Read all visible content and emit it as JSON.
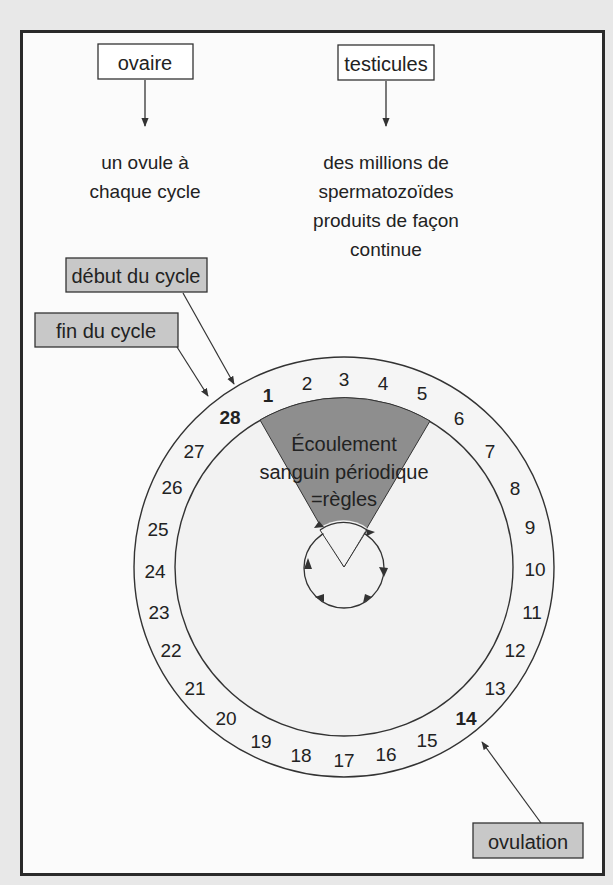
{
  "top_boxes": {
    "ovary": {
      "label": "ovaire",
      "description_lines": [
        "un ovule à",
        "chaque cycle"
      ]
    },
    "testes": {
      "label": "testicules",
      "description_lines": [
        "des millions de",
        "spermatozoïdes",
        "produits de façon",
        "continue"
      ]
    }
  },
  "callouts": {
    "cycle_start": "début du cycle",
    "cycle_end": "fin du cycle",
    "ovulation": "ovulation"
  },
  "cycle_wheel": {
    "days": [
      "1",
      "2",
      "3",
      "4",
      "5",
      "6",
      "7",
      "8",
      "9",
      "10",
      "11",
      "12",
      "13",
      "14",
      "15",
      "16",
      "17",
      "18",
      "19",
      "20",
      "21",
      "22",
      "23",
      "24",
      "25",
      "26",
      "27",
      "28"
    ],
    "bold_days": [
      "1",
      "14",
      "28"
    ],
    "menstruation_lines": [
      "Écoulement",
      "sanguin périodique",
      "=règles"
    ]
  },
  "colors": {
    "background": "#e8e8e8",
    "frame_border": "#2a2a2a",
    "grey_box": "#c8c8c8",
    "wedge": "#8e8e8e",
    "ring": "#f4f4f4"
  }
}
